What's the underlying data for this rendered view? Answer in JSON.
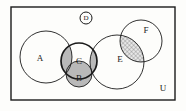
{
  "diagram": {
    "type": "venn-diagram",
    "title": "",
    "universe_label": "U",
    "background_color": "#fdfdfb",
    "stroke_color": "#1a1a1a",
    "shade_color": "#b9b9b9",
    "frame": {
      "x": 11,
      "y": 7,
      "width": 164,
      "height": 93
    },
    "sets": [
      {
        "id": "A",
        "label": "A",
        "cx": 46,
        "cy": 57,
        "r": 26,
        "stroke_width": 0.9,
        "label_x": 40,
        "label_y": 61
      },
      {
        "id": "B",
        "label": "B",
        "cx": 79,
        "cy": 74,
        "r": 13,
        "stroke_width": 0.9,
        "label_x": 79,
        "label_y": 81
      },
      {
        "id": "C",
        "label": "C",
        "cx": 79,
        "cy": 61,
        "r": 18,
        "stroke_width": 1.7,
        "label_x": 79,
        "label_y": 64
      },
      {
        "id": "D",
        "label": "D",
        "cx": 86,
        "cy": 18,
        "r": 6,
        "stroke_width": 1.0,
        "label_x": 86,
        "label_y": 20
      },
      {
        "id": "E",
        "label": "E",
        "cx": 117,
        "cy": 62,
        "r": 27,
        "stroke_width": 0.9,
        "label_x": 120,
        "label_y": 62
      },
      {
        "id": "F",
        "label": "F",
        "cx": 141,
        "cy": 41,
        "r": 21,
        "stroke_width": 0.9,
        "label_x": 146,
        "label_y": 33
      }
    ],
    "shaded_regions": [
      {
        "id": "A-inter-C",
        "sets": [
          "A",
          "C"
        ],
        "fill": "#b9b9b9",
        "pattern": "solid-gray"
      },
      {
        "id": "C-inter-E",
        "sets": [
          "C",
          "E"
        ],
        "fill": "#b9b9b9",
        "pattern": "solid-gray"
      },
      {
        "id": "B-region",
        "sets": [
          "B"
        ],
        "fill": "#b9b9b9",
        "pattern": "solid-gray"
      },
      {
        "id": "E-inter-F",
        "sets": [
          "E",
          "F"
        ],
        "fill": "#c4c4c4",
        "pattern": "crosshatch"
      }
    ],
    "universe_label_x": 163,
    "universe_label_y": 91,
    "label_font_size": 9,
    "universe_font_size": 9
  }
}
